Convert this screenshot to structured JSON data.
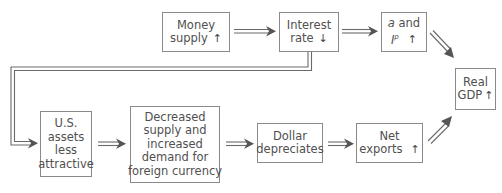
{
  "diagram": {
    "nodes": {
      "money_supply": {
        "lines": [
          "Money",
          "supply"
        ],
        "direction": "↑"
      },
      "interest_rate": {
        "lines": [
          "Interest",
          "rate"
        ],
        "direction": "↓"
      },
      "a_and_ip": {
        "var_a": "a",
        "and": " and",
        "var_ip": "I",
        "sup": "p",
        "direction": "↑"
      },
      "real_gdp": {
        "lines": [
          "Real",
          "GDP"
        ],
        "direction": "↑"
      },
      "us_assets": {
        "lines": [
          "U.S.",
          "assets",
          "less",
          "attractive"
        ]
      },
      "foreign_currency": {
        "lines": [
          "Decreased",
          "supply and",
          "increased",
          "demand for",
          "foreign currency"
        ]
      },
      "dollar": {
        "lines": [
          "Dollar",
          "depreciates"
        ]
      },
      "net_exports": {
        "lines": [
          "Net",
          "exports"
        ],
        "direction": "↑"
      }
    },
    "edges": [
      {
        "from": "money_supply",
        "to": "interest_rate"
      },
      {
        "from": "interest_rate",
        "to": "a_and_ip"
      },
      {
        "from": "a_and_ip",
        "to": "real_gdp"
      },
      {
        "from": "interest_rate",
        "to": "us_assets"
      },
      {
        "from": "us_assets",
        "to": "foreign_currency"
      },
      {
        "from": "foreign_currency",
        "to": "dollar"
      },
      {
        "from": "dollar",
        "to": "net_exports"
      },
      {
        "from": "net_exports",
        "to": "real_gdp"
      }
    ],
    "colors": {
      "stroke": "#8a8a8a",
      "text": "#505050",
      "arrow": "#555555"
    }
  }
}
